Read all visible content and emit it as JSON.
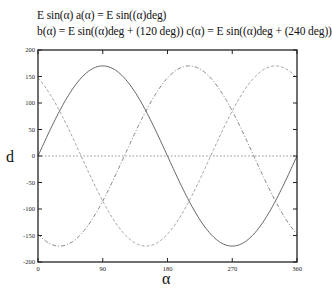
{
  "header": {
    "line1": "E sin(α)   a(α) = E sin((α)deg)",
    "line2": "b(α) = E sin((α)deg + (120 deg))   c(α) = E sin((α)deg + (240 deg))"
  },
  "chart_data": {
    "type": "line",
    "xlabel": "α",
    "ylabel": "d",
    "xlim": [
      0,
      360
    ],
    "ylim": [
      -200,
      200
    ],
    "xticks": [
      0,
      90,
      180,
      270,
      360
    ],
    "yticks": [
      200,
      150,
      100,
      50,
      0,
      -50,
      -100,
      -150,
      -200
    ],
    "grid": false,
    "legend": "none",
    "amplitude_E": 170,
    "x": [
      0,
      30,
      60,
      90,
      120,
      150,
      180,
      210,
      240,
      270,
      300,
      330,
      360
    ],
    "series": [
      {
        "name": "a(α) = E sin((α)deg)",
        "style": "solid",
        "color": "#555555",
        "values": [
          0,
          85,
          147.2,
          170,
          147.2,
          85,
          0,
          -85,
          -147.2,
          -170,
          -147.2,
          -85,
          0
        ]
      },
      {
        "name": "b(α) = E sin((α)deg + (120 deg))",
        "style": "dashed",
        "color": "#999999",
        "values": [
          147.2,
          85,
          0,
          -85,
          -147.2,
          -170,
          -147.2,
          -85,
          0,
          85,
          147.2,
          170,
          147.2
        ]
      },
      {
        "name": "c(α) = E sin((α)deg + (240 deg))",
        "style": "dash-dot",
        "color": "#777777",
        "values": [
          -147.2,
          -170,
          -147.2,
          -85,
          0,
          85,
          147.2,
          170,
          147.2,
          85,
          0,
          -85,
          -147.2
        ]
      },
      {
        "name": "zero line",
        "style": "dotted",
        "color": "#888888",
        "values": [
          0,
          0,
          0,
          0,
          0,
          0,
          0,
          0,
          0,
          0,
          0,
          0,
          0
        ]
      }
    ]
  }
}
